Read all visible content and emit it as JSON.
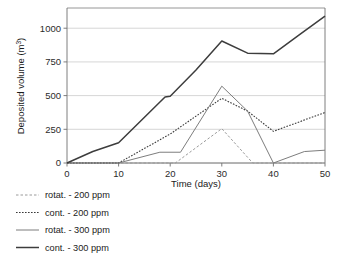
{
  "chart_data": {
    "type": "line",
    "title": "",
    "xlabel": "Time (days)",
    "ylabel": "Deposited volume (m³)",
    "ylabel_base": "Deposited volume (m",
    "ylabel_exp": "3",
    "ylabel_tail": ")",
    "xlim": [
      0,
      50
    ],
    "ylim": [
      0,
      1150
    ],
    "grid": "horizontal",
    "legend_position": "below-left",
    "xticks": [
      0,
      10,
      20,
      30,
      40,
      50
    ],
    "xtick_labels": [
      "0",
      "10",
      "20",
      "30",
      "40",
      "50"
    ],
    "yticks": [
      0,
      250,
      500,
      750,
      1000
    ],
    "ytick_labels": [
      "0",
      "250",
      "500",
      "750",
      "1000"
    ],
    "series": [
      {
        "name": "rotat. - 200 ppm",
        "style": "dashed",
        "color": "#9a9a9a",
        "width": 1.0,
        "dash": "2.5,2.0",
        "x": [
          0,
          10,
          21,
          30,
          36,
          40,
          50
        ],
        "y": [
          0,
          0,
          0,
          255,
          0,
          0,
          0
        ]
      },
      {
        "name": "cont. - 200 ppm",
        "style": "dotted",
        "color": "#3a3a3a",
        "width": 1.1,
        "dash": "1.6,1.4",
        "x": [
          0,
          10,
          20,
          30,
          35,
          40,
          50
        ],
        "y": [
          0,
          0,
          215,
          480,
          385,
          235,
          375
        ]
      },
      {
        "name": "rotat. - 300 ppm",
        "style": "solid",
        "color": "#7d7d7d",
        "width": 1.0,
        "dash": "",
        "x": [
          0,
          10,
          18,
          22,
          30,
          35,
          40,
          46,
          50
        ],
        "y": [
          0,
          0,
          80,
          80,
          570,
          385,
          0,
          85,
          95
        ]
      },
      {
        "name": "cont. - 300 ppm",
        "style": "solid",
        "color": "#3d3d3d",
        "width": 1.5,
        "dash": "",
        "x": [
          0,
          5,
          10,
          19,
          20,
          25,
          30,
          35,
          40,
          45,
          50
        ],
        "y": [
          0,
          85,
          150,
          490,
          495,
          690,
          905,
          815,
          810,
          950,
          1090
        ]
      }
    ]
  },
  "legend": {
    "items": [
      {
        "label": "rotat. - 200 ppm"
      },
      {
        "label": "cont. - 200 ppm"
      },
      {
        "label": "rotat. - 300 ppm"
      },
      {
        "label": "cont. - 300 ppm"
      }
    ]
  },
  "colors": {
    "frame": "#8a8a8a",
    "grid": "#cccccc",
    "axis_text": "#2b2b2b",
    "background": "#ffffff"
  }
}
